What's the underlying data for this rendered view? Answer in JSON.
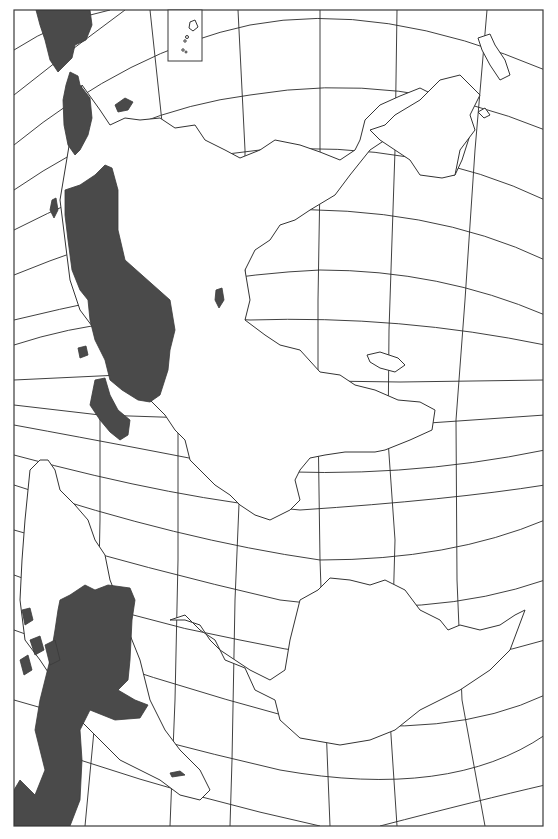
{
  "map": {
    "type": "outline map",
    "projection": "curved graticule (conic-like)",
    "labels": [],
    "colors": {
      "background": "#ffffff",
      "line": "#2a2a2a",
      "shaded_region": "#4a4a4a"
    },
    "frame": {
      "x": 14,
      "y": 10,
      "width": 529,
      "height": 816
    },
    "inset_box": {
      "x": 168,
      "y": 10,
      "width": 34,
      "height": 51
    },
    "shaded_regions": [
      "western landmass top",
      "western landmass middle",
      "western peninsula",
      "southwestern landmass"
    ]
  }
}
